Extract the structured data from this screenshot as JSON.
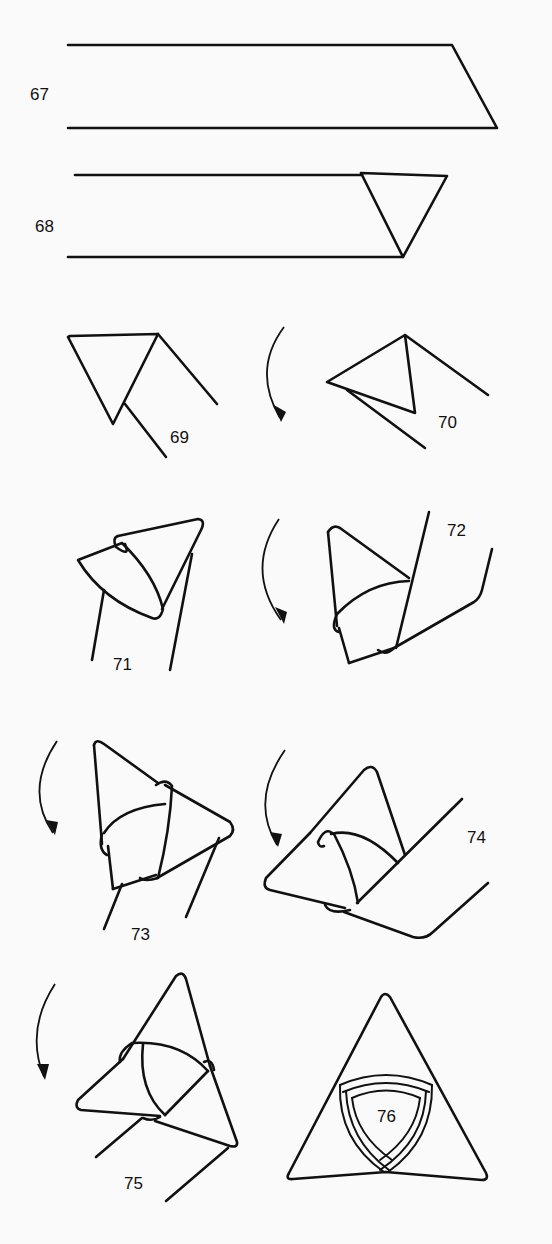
{
  "diagram": {
    "type": "origami-instructions",
    "steps": [
      {
        "id": "67",
        "label": "67"
      },
      {
        "id": "68",
        "label": "68"
      },
      {
        "id": "69",
        "label": "69"
      },
      {
        "id": "70",
        "label": "70"
      },
      {
        "id": "71",
        "label": "71"
      },
      {
        "id": "72",
        "label": "72"
      },
      {
        "id": "73",
        "label": "73"
      },
      {
        "id": "74",
        "label": "74"
      },
      {
        "id": "75",
        "label": "75"
      },
      {
        "id": "76",
        "label": "76"
      }
    ],
    "colors": {
      "ink": "#111111",
      "paper": "#fafafa"
    }
  }
}
